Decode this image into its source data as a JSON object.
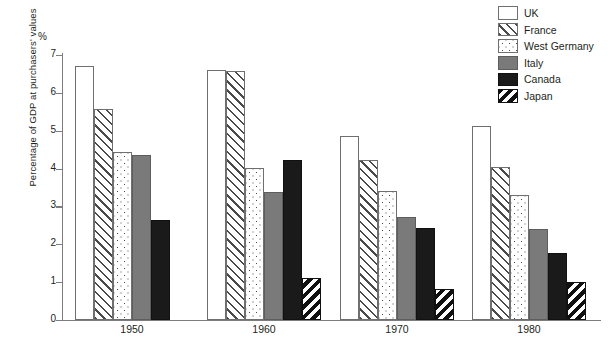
{
  "chart_data": {
    "type": "bar",
    "title": "",
    "subtitle": "",
    "xlabel": "",
    "ylabel": "Percentage of GDP at purchasers' values",
    "unit_symbol": "%",
    "categories": [
      "1950",
      "1960",
      "1970",
      "1980"
    ],
    "ylim": [
      0,
      7
    ],
    "ytick_labels": [
      "0",
      "1",
      "2",
      "3",
      "4",
      "5",
      "6",
      "7"
    ],
    "ytick_values": [
      0,
      1,
      2,
      3,
      4,
      5,
      6,
      7
    ],
    "grid": false,
    "legend_position": "top-right",
    "series": [
      {
        "name": "UK",
        "pattern": "solid-white",
        "values": [
          6.7,
          6.6,
          4.87,
          5.13
        ]
      },
      {
        "name": "France",
        "pattern": "forward-diagonal-hatch",
        "values": [
          5.57,
          6.58,
          4.22,
          4.03
        ]
      },
      {
        "name": "West Germany",
        "pattern": "dotted",
        "values": [
          4.45,
          4.02,
          3.4,
          3.3
        ]
      },
      {
        "name": "Italy",
        "pattern": "solid-grey",
        "values": [
          4.35,
          3.37,
          2.72,
          2.4
        ]
      },
      {
        "name": "Canada",
        "pattern": "solid-black",
        "values": [
          2.65,
          4.22,
          2.42,
          1.78
        ]
      },
      {
        "name": "Japan",
        "pattern": "back-diagonal-hatch-black",
        "values": [
          null,
          1.1,
          0.82,
          1.0
        ]
      }
    ]
  },
  "colors": {
    "axis": "#7d7d7d",
    "text": "#231f20",
    "italy_grey": "#7a7a7a",
    "canada_black": "#1a1a1a",
    "background": "#ffffff"
  }
}
